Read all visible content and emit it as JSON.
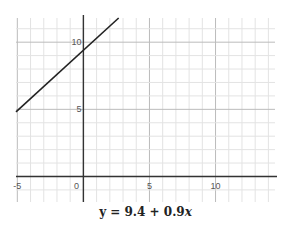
{
  "chart_data": {
    "type": "line",
    "title": "",
    "caption": "y = 9.4 + 0.9x",
    "equation": {
      "intercept": 9.4,
      "slope": 0.9
    },
    "series": [
      {
        "name": "y = 9.4 + 0.9x",
        "x": [
          -5.1,
          2.67
        ],
        "y": [
          4.81,
          11.8
        ]
      }
    ],
    "xlabel": "",
    "ylabel": "",
    "xlim": [
      -5.1,
      14.5
    ],
    "ylim": [
      -1.9,
      11.8
    ],
    "x_ticks": [
      -5,
      0,
      5,
      10
    ],
    "x_tick_labels": [
      "-5",
      "0",
      "5",
      "10"
    ],
    "y_ticks": [
      5,
      10
    ],
    "y_tick_labels": [
      "5",
      "10"
    ],
    "grid": true,
    "minor_grid_step": 1,
    "major_grid_step": 5,
    "colors": {
      "line": "#222222",
      "axis": "#333333",
      "grid_minor": "#e3e3e3",
      "grid_major": "#bbbbbb",
      "tick_text": "#555555"
    }
  },
  "caption": {
    "prefix": "y = 9.4 + 0.9",
    "var": "x"
  }
}
